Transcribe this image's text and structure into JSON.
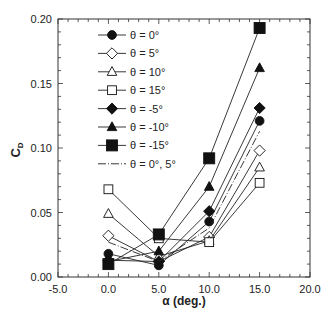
{
  "chart_data": {
    "type": "line",
    "title": "",
    "xlabel": "α (deg.)",
    "ylabel": "C_D",
    "ylabel_main": "C",
    "ylabel_sub": "D",
    "xlim": [
      -5.0,
      20.0
    ],
    "ylim": [
      0.0,
      0.2
    ],
    "x_ticks": [
      -5.0,
      0.0,
      5.0,
      10.0,
      15.0,
      20.0
    ],
    "x_tick_labels": [
      "-5.0",
      "0.0",
      "5.0",
      "10.0",
      "15.0",
      "20.0"
    ],
    "y_ticks": [
      0.0,
      0.05,
      0.1,
      0.15,
      0.2
    ],
    "y_tick_labels": [
      "0.00",
      "0.05",
      "0.10",
      "0.15",
      "0.20"
    ],
    "grid": false,
    "legend_position": "upper left (inside)",
    "x": [
      0.0,
      5.0,
      10.0,
      15.0
    ],
    "series": [
      {
        "name": "θ = 0°",
        "marker": "circle",
        "filled": true,
        "dash": "solid",
        "values": [
          0.018,
          0.009,
          0.043,
          0.121
        ]
      },
      {
        "name": "θ = 5°",
        "marker": "diamond",
        "filled": false,
        "dash": "solid",
        "values": [
          0.032,
          0.012,
          0.031,
          0.098
        ]
      },
      {
        "name": "θ = 10°",
        "marker": "triangle",
        "filled": false,
        "dash": "solid",
        "values": [
          0.049,
          0.016,
          0.028,
          0.085
        ]
      },
      {
        "name": "θ = 15°",
        "marker": "square",
        "filled": false,
        "dash": "solid",
        "values": [
          0.068,
          0.03,
          0.027,
          0.073
        ]
      },
      {
        "name": "θ = -5°",
        "marker": "diamond",
        "filled": true,
        "dash": "solid",
        "values": [
          0.013,
          0.012,
          0.051,
          0.131
        ]
      },
      {
        "name": "θ = -10°",
        "marker": "triangle",
        "filled": true,
        "dash": "solid",
        "values": [
          0.012,
          0.02,
          0.07,
          0.162
        ]
      },
      {
        "name": "θ = -15°",
        "marker": "square",
        "filled": true,
        "dash": "solid",
        "values": [
          0.01,
          0.033,
          0.092,
          0.193
        ]
      },
      {
        "name": "θ = 0°, 5°",
        "marker": "none",
        "filled": false,
        "dash": "dashdot",
        "values": [
          0.027,
          0.012,
          0.038,
          0.113
        ]
      }
    ]
  }
}
